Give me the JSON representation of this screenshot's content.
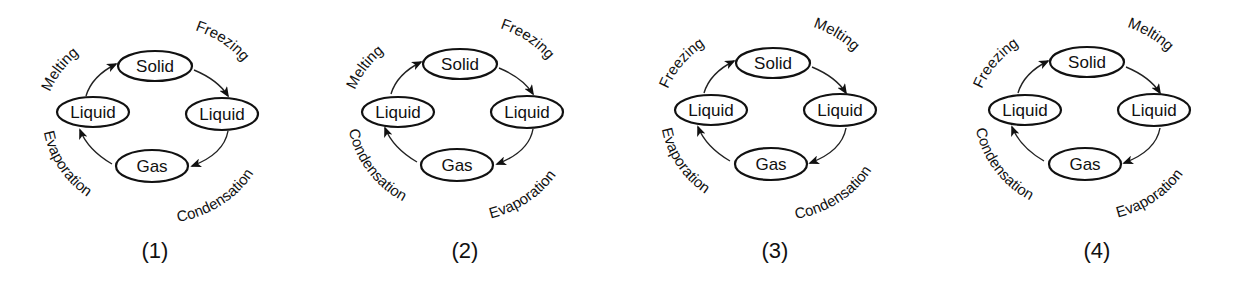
{
  "diagrams": [
    {
      "label": "(1)",
      "states": {
        "top": "Solid",
        "left": "Liquid",
        "right": "Liquid",
        "bottom": "Gas"
      },
      "processes": {
        "top_left": "Melting",
        "top_right": "Freezing",
        "bottom_right": "Condensation",
        "bottom_left": "Evaporation"
      }
    },
    {
      "label": "(2)",
      "states": {
        "top": "Solid",
        "left": "Liquid",
        "right": "Liquid",
        "bottom": "Gas"
      },
      "processes": {
        "top_left": "Melting",
        "top_right": "Freezing",
        "bottom_right": "Evaporation",
        "bottom_left": "Condensation"
      }
    },
    {
      "label": "(3)",
      "states": {
        "top": "Solid",
        "left": "Liquid",
        "right": "Liquid",
        "bottom": "Gas"
      },
      "processes": {
        "top_left": "Freezing",
        "top_right": "Melting",
        "bottom_right": "Condensation",
        "bottom_left": "Evaporation"
      }
    },
    {
      "label": "(4)",
      "states": {
        "top": "Solid",
        "left": "Liquid",
        "right": "Liquid",
        "bottom": "Gas"
      },
      "processes": {
        "top_left": "Freezing",
        "top_right": "Melting",
        "bottom_right": "Evaporation",
        "bottom_left": "Condensation"
      }
    }
  ],
  "arrow_direction": "clockwise: left Liquid → Solid → right Liquid → Gas → left Liquid"
}
